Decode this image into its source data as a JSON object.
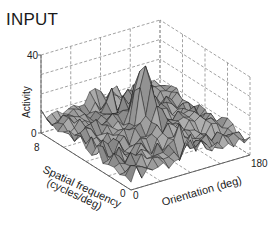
{
  "panel": {
    "title": "INPUT"
  },
  "chart_data": {
    "type": "surface3d",
    "title": "INPUT",
    "zlabel": "Activity",
    "xlabel": "Orientation (deg)",
    "ylabel": "Spatial frequency (cycles/deg)",
    "zlim": [
      0,
      40
    ],
    "xlim": [
      0,
      180
    ],
    "ylim": [
      0,
      8
    ],
    "z_ticks": [
      "0",
      "40"
    ],
    "x_ticks": [
      "0",
      "180"
    ],
    "y_ticks": [
      "8",
      "0"
    ],
    "grid": true,
    "grid_style": "dashed",
    "surface_color": "#9a9a9a",
    "edge_color": "#1a1a1a",
    "peak": {
      "orientation": 90,
      "spatial_frequency": 4,
      "activity": 35
    },
    "baseline_range": [
      2,
      14
    ]
  },
  "axes": {
    "z_label": "Activity",
    "z_tick_top": "40",
    "z_tick_bottom": "0",
    "y_tick_far": "8",
    "y_tick_near": "0",
    "x_tick_near": "0",
    "x_tick_far": "180",
    "y_label_line1": "Spatial frequency",
    "y_label_line2": "(cycles/deg)",
    "x_label": "Orientation (deg)"
  }
}
